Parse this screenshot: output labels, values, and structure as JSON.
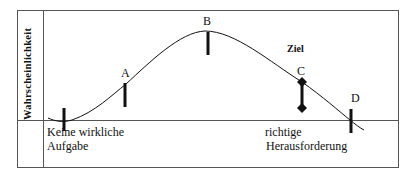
{
  "diagram": {
    "y_axis_label": "Wahrscheinlichkeit",
    "goal_label": "Ziel",
    "points": [
      {
        "id": "A",
        "label": "A"
      },
      {
        "id": "B",
        "label": "B"
      },
      {
        "id": "C",
        "label": "C"
      },
      {
        "id": "D",
        "label": "D"
      }
    ],
    "bottom_labels": {
      "left_line1": "Keine wirkliche",
      "left_line2": "Aufgabe",
      "right_line1": "richtige",
      "right_line2": "Herausforderung"
    },
    "colors": {
      "line": "#111111",
      "frame": "#555555",
      "background": "#ffffff"
    }
  }
}
